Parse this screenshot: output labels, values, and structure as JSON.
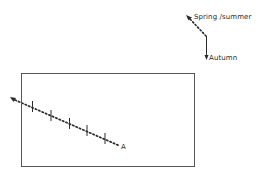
{
  "legend": {
    "spring_summer_label": "Spring /summer",
    "autumn_label": "Autumn"
  },
  "path": {
    "end_label": "A"
  },
  "colors": {
    "ink": "#2a2a2a",
    "frame": "#555555",
    "background": "#ffffff"
  }
}
